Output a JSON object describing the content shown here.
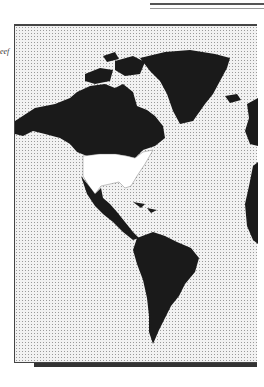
{
  "header": {
    "label_fragment": "eef"
  },
  "map": {
    "region": "Americas",
    "highlighted_country": "United States",
    "land_color": "#1a1a1a",
    "highlight_color": "#ffffff",
    "ocean_pattern": "stipple"
  }
}
